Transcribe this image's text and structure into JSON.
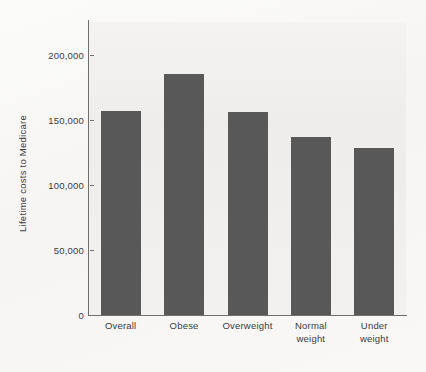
{
  "chart_data": {
    "type": "bar",
    "title": "",
    "xlabel": "",
    "ylabel": "Lifetime costs to Medicare",
    "categories": [
      "Overall",
      "Obese",
      "Overweight",
      "Normal weight",
      "Under weight"
    ],
    "category_lines": [
      [
        "Overall"
      ],
      [
        "Obese"
      ],
      [
        "Overweight"
      ],
      [
        "Normal",
        "weight"
      ],
      [
        "Under",
        "weight"
      ]
    ],
    "values": [
      157000,
      185000,
      156000,
      137000,
      128000
    ],
    "ylim": [
      0,
      225000
    ],
    "yticks": [
      0,
      50000,
      100000,
      150000,
      200000
    ],
    "ytick_labels": [
      "0",
      "50,000",
      "100,000",
      "150,000",
      "200,000"
    ],
    "grid": false,
    "legend": "none",
    "bar_color": "#585858",
    "axis_color": "#6f6f6f",
    "plot_background": "#f1f0ee"
  }
}
